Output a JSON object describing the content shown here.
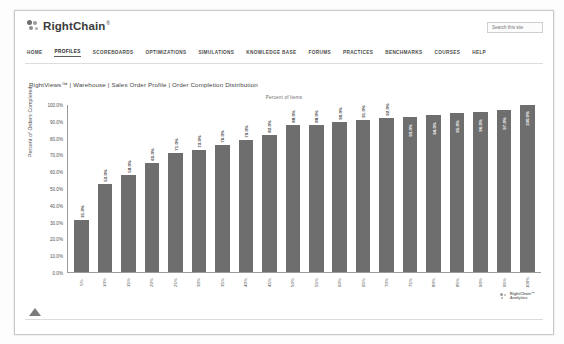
{
  "header": {
    "brand_name": "RightChain",
    "brand_tm": "®",
    "search_placeholder": "Search this site"
  },
  "nav": {
    "items": [
      {
        "label": "HOME",
        "active": false
      },
      {
        "label": "PROFILES",
        "active": true
      },
      {
        "label": "SCOREBOARDS",
        "active": false
      },
      {
        "label": "OPTIMIZATIONS",
        "active": false
      },
      {
        "label": "SIMULATIONS",
        "active": false
      },
      {
        "label": "KNOWLEDGE BASE",
        "active": false
      },
      {
        "label": "FORUMS",
        "active": false
      },
      {
        "label": "PRACTICES",
        "active": false
      },
      {
        "label": "BENCHMARKS",
        "active": false
      },
      {
        "label": "COURSES",
        "active": false
      },
      {
        "label": "HELP",
        "active": false
      }
    ]
  },
  "breadcrumb": {
    "text": "RightViews™ | Warehouse | Sales Order Profile | Order Completion Distribution"
  },
  "watermark": {
    "line1": "RightChain™",
    "line2": "Analytics"
  },
  "colors": {
    "bar": "#6e6e6e",
    "axis": "#9b9b9b",
    "label_outside": "#3c3c3c",
    "label_inside": "#ffffff"
  },
  "chart_data": {
    "type": "bar",
    "title": "Percent of Items",
    "xlabel": "",
    "ylabel": "Percent of Orders Completed",
    "ylim": [
      0,
      100
    ],
    "grid": false,
    "legend": "none",
    "ytick_labels": [
      "100.0%",
      "90.0%",
      "80.0%",
      "70.0%",
      "60.0%",
      "50.0%",
      "40.0%",
      "30.0%",
      "20.0%",
      "10.0%",
      "0.0%"
    ],
    "ytick_values": [
      100,
      90,
      80,
      70,
      60,
      50,
      40,
      30,
      20,
      10,
      0
    ],
    "categories": [
      "5%",
      "10%",
      "15%",
      "20%",
      "25%",
      "30%",
      "35%",
      "40%",
      "45%",
      "50%",
      "55%",
      "60%",
      "65%",
      "70%",
      "75%",
      "80%",
      "85%",
      "90%",
      "95%",
      "100%"
    ],
    "values": [
      31.0,
      53.0,
      58.0,
      65.0,
      71.0,
      73.0,
      76.0,
      79.0,
      82.0,
      88.0,
      88.0,
      90.0,
      91.0,
      92.0,
      93.0,
      94.0,
      95.0,
      96.0,
      97.0,
      100.0
    ],
    "data_labels": [
      "31.0%",
      "53.0%",
      "58.0%",
      "65.0%",
      "71.0%",
      "73.0%",
      "76.0%",
      "79.0%",
      "82.0%",
      "88.0%",
      "88.0%",
      "90.0%",
      "91.0%",
      "92.0%",
      "93.0%",
      "94.0%",
      "95.0%",
      "96.0%",
      "97.0%",
      "100.0%"
    ],
    "label_placement": [
      "outside",
      "outside",
      "outside",
      "outside",
      "outside",
      "outside",
      "outside",
      "outside",
      "outside",
      "outside",
      "outside",
      "outside",
      "outside",
      "outside",
      "inside",
      "inside",
      "inside",
      "inside",
      "inside",
      "inside"
    ]
  }
}
